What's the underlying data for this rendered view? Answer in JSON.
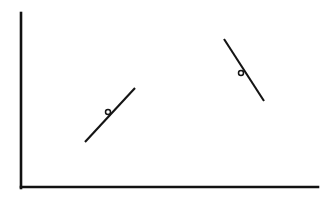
{
  "figure": {
    "title": "",
    "background_color": "#ffffff",
    "ink_color": "#141414",
    "axis_color": "#111111",
    "width": 332,
    "height": 199
  },
  "chart_data": {
    "type": "line",
    "title": "",
    "subtitle": "",
    "xlabel": "",
    "ylabel": "",
    "grid": false,
    "legend": null,
    "xticks": [],
    "yticks": [],
    "xtick_labels": [],
    "ytick_labels": [],
    "axis_style": "L-shaped spines, no ticks, no tick labels",
    "annotations": [],
    "axes_pixel": {
      "y_axis": {
        "x": 21,
        "y_top": 13,
        "y_bottom": 188
      },
      "x_axis": {
        "y": 187,
        "x_left": 21,
        "x_right": 318
      }
    },
    "series": [
      {
        "name": "segment-1",
        "description": "short straight segment with positive slope, open circle marker at midpoint",
        "slope_sign": "positive",
        "marker": "open-circle",
        "marker_size_px": 5,
        "points_pixel": [
          {
            "x": 85,
            "y": 142
          },
          {
            "x": 135,
            "y": 88
          }
        ],
        "marker_pixel": {
          "x": 108,
          "y": 112
        }
      },
      {
        "name": "segment-2",
        "description": "short straight segment with negative slope, open circle marker at midpoint",
        "slope_sign": "negative",
        "marker": "open-circle",
        "marker_size_px": 5,
        "points_pixel": [
          {
            "x": 224,
            "y": 39
          },
          {
            "x": 264,
            "y": 101
          }
        ],
        "marker_pixel": {
          "x": 241,
          "y": 73
        }
      }
    ]
  }
}
